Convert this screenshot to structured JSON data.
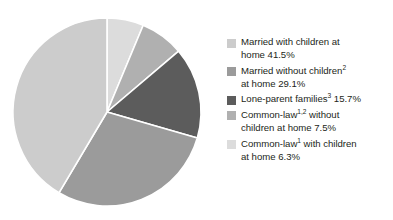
{
  "chart_data": {
    "type": "pie",
    "title": "",
    "subtitle": "",
    "xlabel": "",
    "ylabel": "",
    "legend_position": "right",
    "grid": false,
    "units": "percent",
    "categories": [
      "Married with children at home",
      "Married without children at home",
      "Lone-parent families",
      "Common-law without children at home",
      "Common-law with children at home"
    ],
    "values": [
      41.5,
      29.1,
      15.7,
      7.5,
      6.3
    ],
    "value_labels": [
      "41.5%",
      "29.1%",
      "15.7%",
      "7.5%",
      "6.3%"
    ],
    "colors": [
      "#cccccc",
      "#9b9b9b",
      "#5c5c5c",
      "#b0b0b0",
      "#dcdcdc"
    ],
    "slice_order_clockwise_from_12": [
      "Common-law with children at home",
      "Common-law without children at home",
      "Lone-parent families",
      "Married without children at home",
      "Married with children at home"
    ],
    "separator_color": "#ffffff"
  },
  "legend": {
    "items": [
      {
        "swatch_color": "#cccccc",
        "text_before": "Married with children at\nhome 41.5%",
        "sup": "",
        "text_after": "",
        "value": 41.5,
        "value_label": "41.5%"
      },
      {
        "swatch_color": "#9b9b9b",
        "text_before": "Married without children",
        "sup": "2",
        "text_after": "\nat home 29.1%",
        "value": 29.1,
        "value_label": "29.1%"
      },
      {
        "swatch_color": "#5c5c5c",
        "text_before": "Lone-parent families",
        "sup": "3",
        "text_after": " 15.7%",
        "value": 15.7,
        "value_label": "15.7%"
      },
      {
        "swatch_color": "#b0b0b0",
        "text_before": "Common-law",
        "sup": "1,2",
        "text_after": " without\nchildren at home 7.5%",
        "value": 7.5,
        "value_label": "7.5%"
      },
      {
        "swatch_color": "#dcdcdc",
        "text_before": "Common-law",
        "sup": "1",
        "text_after": " with children\nat home 6.3%",
        "value": 6.3,
        "value_label": "6.3%"
      }
    ]
  }
}
